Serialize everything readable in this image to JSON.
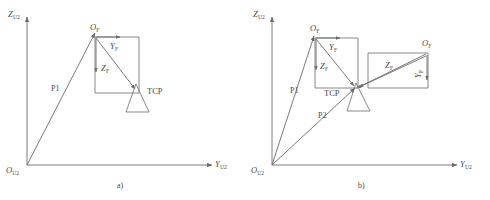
{
  "figure": {
    "type": "diagram",
    "stroke_color": "#6b6b6b",
    "text_color": "#4a4a4a",
    "background": "#ffffff",
    "panels": [
      {
        "id": "a",
        "caption": "a)",
        "axes": {
          "vertical_label": "Z",
          "vertical_sub": "U2",
          "horizontal_label": "Y",
          "horizontal_sub": "U2",
          "origin_label": "O",
          "origin_sub": "U2"
        },
        "vectors": [
          {
            "name": "P1",
            "label": "P1",
            "from": "O_U2",
            "to": "O_F"
          }
        ],
        "frames": [
          {
            "origin_label": "O",
            "origin_sub": "F",
            "axis_y_label": "Y",
            "axis_y_sub": "F",
            "axis_z_label": "Z",
            "axis_z_sub": "F",
            "tool_label": "TCP"
          }
        ]
      },
      {
        "id": "b",
        "caption": "b)",
        "axes": {
          "vertical_label": "Z",
          "vertical_sub": "U2",
          "horizontal_label": "Y",
          "horizontal_sub": "U2",
          "origin_label": "O",
          "origin_sub": "U2"
        },
        "vectors": [
          {
            "name": "P1",
            "label": "P1",
            "from": "O_U2",
            "to": "O_F_left"
          },
          {
            "name": "P2",
            "label": "P2",
            "from": "O_U2",
            "to": "TCP"
          }
        ],
        "frames": [
          {
            "origin_label": "O",
            "origin_sub": "F",
            "axis_y_label": "Y",
            "axis_y_sub": "F",
            "axis_z_label": "Z",
            "axis_z_sub": "F",
            "tool_label": "TCP"
          },
          {
            "origin_label": "O",
            "origin_sub": "F",
            "axis_y_label": "Y",
            "axis_y_sub": "F",
            "axis_z_label": "Z",
            "axis_z_sub": "F"
          }
        ]
      }
    ]
  }
}
